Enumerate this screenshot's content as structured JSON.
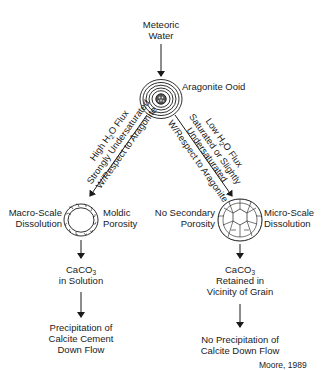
{
  "diagram": {
    "source_node": {
      "line1": "Meteoric",
      "line2": "Water"
    },
    "center_node": {
      "label": "Aragonite Ooid"
    },
    "left_branch": {
      "condition": {
        "line1_pre": "High H",
        "line1_sub": "2",
        "line1_post": "O Flux",
        "line2": "Strongly Undersaturated",
        "line3": "W/Respect to Aragonite"
      },
      "grain_left_label": {
        "line1": "Macro-Scale",
        "line2": "Dissolution"
      },
      "grain_right_label": {
        "line1": "Moldic",
        "line2": "Porosity"
      },
      "step2": {
        "pre": "CaCO",
        "sub": "3",
        "line2": "in Solution"
      },
      "step3": {
        "line1": "Precipitation of",
        "line2": "Calcite Cement",
        "line3": "Down Flow"
      }
    },
    "right_branch": {
      "condition": {
        "line1_pre": "Low H",
        "line1_sub": "2",
        "line1_post": "O Flux",
        "line2": "Saturated or Slightly",
        "line3": "Undersaturated",
        "line4": "W/Respect to Aragonite"
      },
      "grain_left_label": {
        "line1": "No Secondary",
        "line2": "Porosity"
      },
      "grain_right_label": {
        "line1": "Micro-Scale",
        "line2": "Dissolution"
      },
      "step2": {
        "pre": "CaCO",
        "sub": "3",
        "line2": "Retained in",
        "line3": "Vicinity of Grain"
      },
      "step3": {
        "line1": "No Precipitation of",
        "line2": "Calcite Down Flow"
      }
    },
    "credit": "Moore, 1989",
    "colors": {
      "ink": "#1a1a1a",
      "background": "#ffffff"
    }
  }
}
